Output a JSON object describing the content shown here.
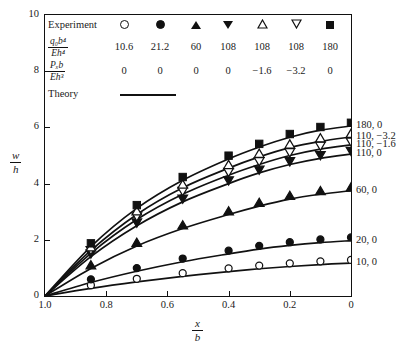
{
  "chart_data": {
    "type": "line",
    "title": "",
    "xlabel": "x/b",
    "ylabel": "w/h",
    "xlim": [
      1.0,
      0.0
    ],
    "ylim": [
      0,
      10
    ],
    "x_ticks": [
      "1.0",
      "0.8",
      "0.6",
      "0.4",
      "0.2",
      "0"
    ],
    "x_tick_values": [
      1.0,
      0.8,
      0.6,
      0.4,
      0.2,
      0.0
    ],
    "y_ticks": [
      "0",
      "2",
      "4",
      "6",
      "8",
      "10"
    ],
    "y_tick_values": [
      0,
      2,
      4,
      6,
      8,
      10
    ],
    "grid": false,
    "axis_note": "x axis is reversed: 1.0 at left, 0 at right",
    "legend_position": "inside-top-left",
    "legend_title": "Experiment",
    "theory_label": "Theory",
    "header_row_1": {
      "num": "q₀b⁴",
      "den": "Eh⁴"
    },
    "header_row_2": {
      "num": "Pₓb",
      "den": "Eh³"
    },
    "q_values": [
      "10.6",
      "21.2",
      "60",
      "108",
      "108",
      "108",
      "180"
    ],
    "p_values": [
      "0",
      "0",
      "0",
      "0",
      "−1.6",
      "−3.2",
      "0"
    ],
    "markers": [
      "open-circle",
      "filled-circle",
      "filled-up-triangle",
      "filled-down-triangle",
      "open-up-triangle",
      "open-down-triangle",
      "filled-square"
    ],
    "x": [
      1.0,
      0.85,
      0.7,
      0.55,
      0.4,
      0.3,
      0.2,
      0.1,
      0.0
    ],
    "series": [
      {
        "name": "10, 0",
        "right_label": "10, 0",
        "marker": "open-circle",
        "q": "10.6",
        "p": "0",
        "values": [
          0.0,
          0.27,
          0.5,
          0.7,
          0.87,
          0.97,
          1.05,
          1.12,
          1.17
        ]
      },
      {
        "name": "20, 0",
        "right_label": "20, 0",
        "marker": "filled-circle",
        "q": "21.2",
        "p": "0",
        "values": [
          0.0,
          0.48,
          0.88,
          1.22,
          1.5,
          1.67,
          1.8,
          1.9,
          1.97
        ]
      },
      {
        "name": "60, 0",
        "right_label": "60, 0",
        "marker": "filled-up-triangle",
        "q": "60",
        "p": "0",
        "values": [
          0.0,
          0.98,
          1.78,
          2.4,
          2.9,
          3.2,
          3.45,
          3.62,
          3.75
        ]
      },
      {
        "name": "110, 0",
        "right_label": "110, 0",
        "marker": "filled-down-triangle",
        "q": "108",
        "p": "0",
        "values": [
          0.0,
          1.4,
          2.5,
          3.35,
          4.0,
          4.38,
          4.68,
          4.9,
          5.05
        ]
      },
      {
        "name": "110, -1.6",
        "right_label": "110, −1.6",
        "marker": "open-down-triangle",
        "q": "108",
        "p": "−1.6",
        "values": [
          0.0,
          1.52,
          2.72,
          3.62,
          4.3,
          4.68,
          5.0,
          5.23,
          5.38
        ]
      },
      {
        "name": "110, -3.2",
        "right_label": "110, −3.2",
        "marker": "open-up-triangle",
        "q": "108",
        "p": "−3.2",
        "values": [
          0.0,
          1.62,
          2.9,
          3.85,
          4.55,
          4.95,
          5.28,
          5.5,
          5.66
        ]
      },
      {
        "name": "180, 0",
        "right_label": "180, 0",
        "marker": "filled-square",
        "q": "180",
        "p": "0",
        "values": [
          0.0,
          1.76,
          3.12,
          4.12,
          4.88,
          5.3,
          5.65,
          5.9,
          6.05
        ]
      }
    ],
    "colors": {
      "line": "#111111",
      "axis": "#111111",
      "background": "#ffffff"
    }
  }
}
